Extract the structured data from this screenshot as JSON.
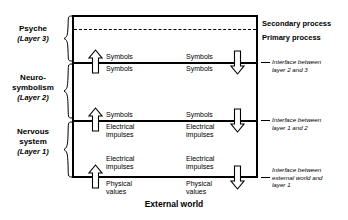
{
  "diagram": {
    "title_caption": "External world",
    "layers": [
      {
        "name": "Psyche",
        "sub": "(Layer 3)"
      },
      {
        "name": "Neuro-\nsymbolism",
        "sub": "(Layer 2)"
      },
      {
        "name": "Nervous\nsystem",
        "sub": "(Layer 1)"
      }
    ],
    "layer_names": {
      "psyche": "Psyche",
      "psyche_sub": "(Layer 3)",
      "neuro_line1": "Neuro-",
      "neuro_line2": "symbolism",
      "neuro_sub": "(Layer 2)",
      "nervous_line1": "Nervous",
      "nervous_line2": "system",
      "nervous_sub": "(Layer 1)"
    },
    "processes": {
      "secondary": "Secondary process",
      "primary": "Primary process"
    },
    "interfaces": [
      {
        "line1": "Interface between",
        "line2": "layer 2 and 3",
        "line3": ""
      },
      {
        "line1": "Interface between",
        "line2": "layer 1 and 2",
        "line3": ""
      },
      {
        "line1": "Interface between",
        "line2": "external world and",
        "line3": "layer 1"
      }
    ],
    "flows": {
      "symbols": "Symbols",
      "electrical_line1": "Electrical",
      "electrical_line2": "impulses",
      "physical_line1": "Physical",
      "physical_line2": "values"
    },
    "flow_pairs": [
      {
        "above": "Symbols",
        "below": "Symbols",
        "boundary": "layer-2-3"
      },
      {
        "above": "Symbols",
        "below": "Electrical impulses",
        "boundary": "layer-1-2"
      },
      {
        "above": "Electrical impulses",
        "below": "Physical values",
        "boundary": "external-layer-1"
      }
    ],
    "arrows": {
      "up_label": "upward flow",
      "down_label": "downward flow",
      "count_up": 3,
      "count_down": 3
    },
    "colors": {
      "stroke": "#000000",
      "background": "#ffffff"
    }
  }
}
